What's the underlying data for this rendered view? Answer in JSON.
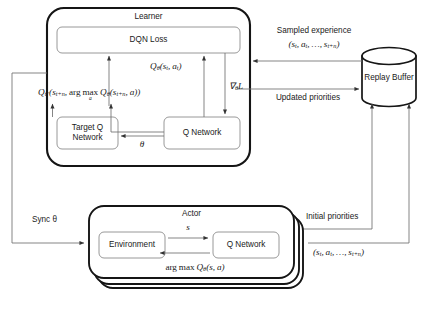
{
  "diagram": {
    "type": "block-diagram",
    "background_color": "#ffffff",
    "stroke_color": "#1a1a1a",
    "thin_stroke_color": "#6f6f6f"
  },
  "learner": {
    "title": "Learner",
    "dqn_loss": "DQN Loss",
    "target_q_network": "Target Q\nNetwork",
    "target_q_network_line1": "Target Q",
    "target_q_network_line2": "Network",
    "q_network": "Q Network",
    "theta_label": "θ",
    "q_online_label": "Qθ(st, at)",
    "q_target_label": "Qθ'(st+n, arg max a Qθ(st+n, a))",
    "grad_label": "∇θL"
  },
  "replay_buffer": {
    "label": "Replay Buffer",
    "shape": "cylinder"
  },
  "actor": {
    "title": "Actor",
    "environment": "Environment",
    "q_network": "Q Network",
    "state_label": "s",
    "action_label": "arg max Qθ(s, a)",
    "stack_count": 3
  },
  "edges": {
    "sampled_experience": "Sampled experience",
    "sampled_experience_tuple": "(st, at, …, st+n)",
    "updated_priorities": "Updated priorities",
    "initial_priorities": "Initial priorities",
    "initial_priorities_tuple": "(st, at, …, st+n)",
    "sync_theta": "Sync θ"
  }
}
